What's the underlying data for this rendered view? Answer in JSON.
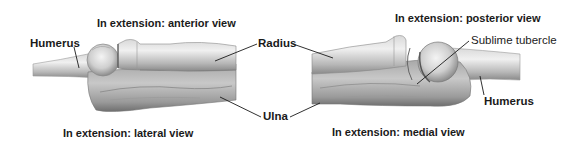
{
  "figure": {
    "views": [
      {
        "id": "anterior",
        "title": "In extension: anterior view"
      },
      {
        "id": "posterior",
        "title": "In extension: posterior view"
      },
      {
        "id": "lateral",
        "title": "In extension: lateral view"
      },
      {
        "id": "medial",
        "title": "In extension: medial view"
      }
    ],
    "labels": {
      "humerus_left": "Humerus",
      "radius": "Radius",
      "ulna": "Ulna",
      "sublime_tubercle": "Sublime tubercle",
      "humerus_right": "Humerus"
    },
    "colors": {
      "bone_light": "#e6e6e6",
      "bone_mid": "#bdbdbd",
      "bone_dark": "#7a7a7a",
      "leader_line": "#1a1a1a",
      "text": "#1a1a1a"
    }
  }
}
